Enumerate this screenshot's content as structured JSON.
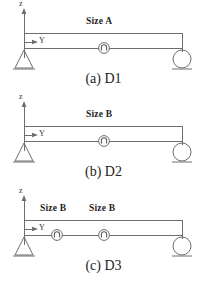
{
  "figure": {
    "background_color": "#ffffff",
    "line_color": "#6e6e6e",
    "text_color": "#242424",
    "panels": [
      {
        "id": "d1",
        "caption": "(a) D1",
        "axis_z_label": "z",
        "axis_y_label": "Y",
        "left_support": "pin-support",
        "right_support": "roller-support",
        "size_labels": [
          {
            "text": "Size A",
            "x": 86,
            "y": 17
          }
        ],
        "node_markers": [
          {
            "name": "node-marker-center",
            "x": 104,
            "y": 48
          }
        ]
      },
      {
        "id": "d2",
        "caption": "(b) D2",
        "axis_z_label": "z",
        "axis_y_label": "Y",
        "left_support": "pin-support",
        "right_support": "roller-support",
        "size_labels": [
          {
            "text": "Size B",
            "x": 86,
            "y": 17
          }
        ],
        "node_markers": [
          {
            "name": "node-marker-center",
            "x": 104,
            "y": 48
          }
        ]
      },
      {
        "id": "d3",
        "caption": "(c) D3",
        "axis_z_label": "z",
        "axis_y_label": "Y",
        "left_support": "pin-support",
        "right_support": "roller-support",
        "size_labels": [
          {
            "text": "Size B",
            "x": 40,
            "y": 17
          },
          {
            "text": "Size B",
            "x": 89,
            "y": 17
          }
        ],
        "node_markers": [
          {
            "name": "node-marker-left",
            "x": 57,
            "y": 48
          },
          {
            "name": "node-marker-right",
            "x": 104,
            "y": 48
          }
        ]
      }
    ]
  }
}
